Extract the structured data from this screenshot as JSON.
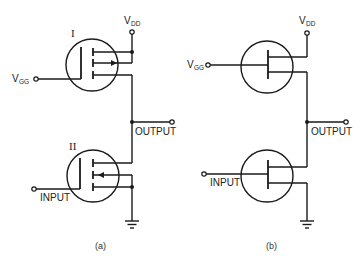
{
  "figure": {
    "panels": [
      {
        "id": "a",
        "caption": "(a)",
        "upper_transistor": {
          "label": "I",
          "type": "enhancement MOSFET with substrate arrow"
        },
        "lower_transistor": {
          "label": "II",
          "type": "enhancement MOSFET with substrate arrow"
        },
        "labels": {
          "vdd_main": "V",
          "vdd_sub": "DD",
          "vgg_main": "V",
          "vgg_sub": "GG",
          "output": "OUTPUT",
          "input": "INPUT"
        }
      },
      {
        "id": "b",
        "caption": "(b)",
        "upper_transistor": {
          "type": "FET (simplified symbol)"
        },
        "lower_transistor": {
          "type": "FET (simplified symbol)"
        },
        "labels": {
          "vdd_main": "V",
          "vdd_sub": "DD",
          "vgg_main": "V",
          "vgg_sub": "GG",
          "output": "OUTPUT",
          "input": "INPUT"
        }
      }
    ],
    "colors": {
      "ink": "#1a1a1a",
      "background": "#ffffff"
    }
  }
}
